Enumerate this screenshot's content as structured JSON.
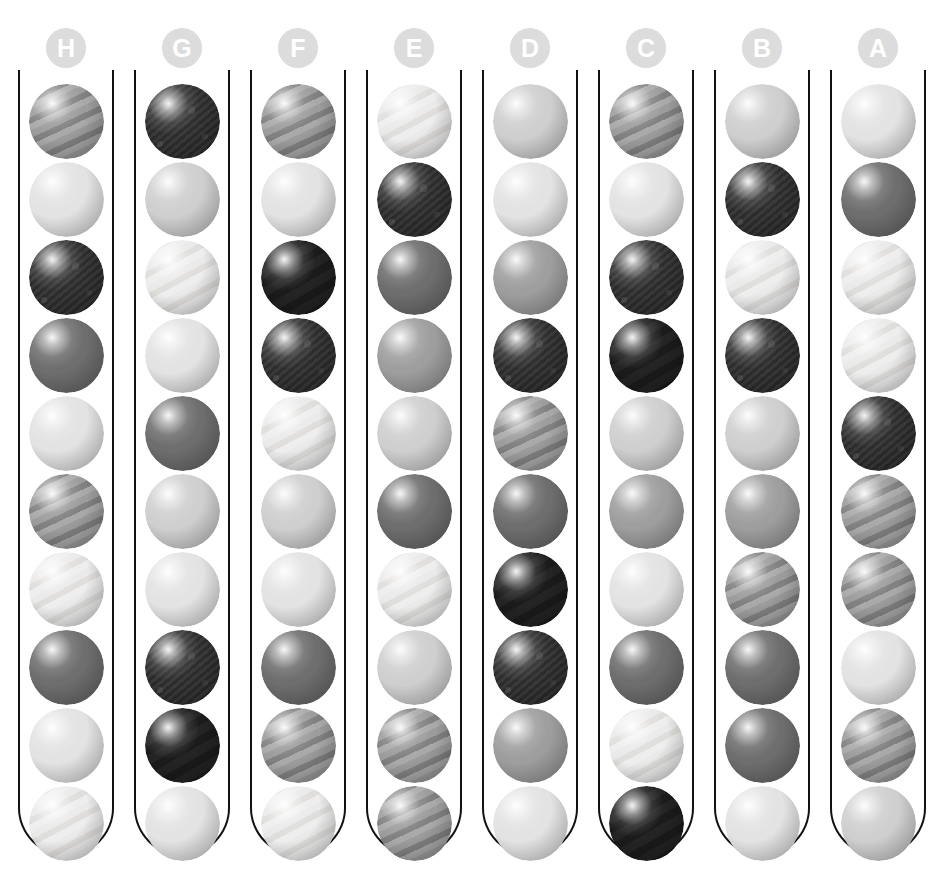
{
  "app": {
    "title": "Ball Sort Puzzle",
    "background_color": "#ffffff",
    "tube_outline_color": "#111111",
    "label_disc_color": "#dcdcdc",
    "label_text_color": "#ffffff"
  },
  "legend": {
    "ball_variants": [
      {
        "id": "v1",
        "name": "very-light-plain",
        "color": "#e3e3e3"
      },
      {
        "id": "v2",
        "name": "very-light-striped",
        "color": "#eaeaea"
      },
      {
        "id": "v3",
        "name": "light-grey-plain",
        "color": "#cfcfcf"
      },
      {
        "id": "v4",
        "name": "medium-grey-plain",
        "color": "#9e9e9e"
      },
      {
        "id": "v5",
        "name": "medium-grey-striped",
        "color": "#9a9a9a"
      },
      {
        "id": "v6",
        "name": "dark-grey-plain",
        "color": "#6e6e6e"
      },
      {
        "id": "v7",
        "name": "near-black-mottled",
        "color": "#333333"
      },
      {
        "id": "v8",
        "name": "black-plain",
        "color": "#202020"
      }
    ]
  },
  "board": {
    "tube_count": 8,
    "balls_per_tube": 10,
    "tubes": [
      {
        "label": "H",
        "balls": [
          "v5",
          "v1",
          "v7",
          "v6",
          "v1",
          "v5",
          "v2",
          "v6",
          "v1",
          "v2"
        ]
      },
      {
        "label": "G",
        "balls": [
          "v7",
          "v3",
          "v2",
          "v1",
          "v6",
          "v3",
          "v1",
          "v7",
          "v8",
          "v1"
        ]
      },
      {
        "label": "F",
        "balls": [
          "v5",
          "v1",
          "v8",
          "v7",
          "v2",
          "v3",
          "v1",
          "v6",
          "v5",
          "v2"
        ]
      },
      {
        "label": "E",
        "balls": [
          "v2",
          "v7",
          "v6",
          "v4",
          "v3",
          "v6",
          "v2",
          "v3",
          "v5",
          "v5"
        ]
      },
      {
        "label": "D",
        "balls": [
          "v3",
          "v1",
          "v4",
          "v7",
          "v5",
          "v6",
          "v8",
          "v7",
          "v4",
          "v1"
        ]
      },
      {
        "label": "C",
        "balls": [
          "v5",
          "v1",
          "v7",
          "v8",
          "v3",
          "v4",
          "v1",
          "v6",
          "v2",
          "v8"
        ]
      },
      {
        "label": "B",
        "balls": [
          "v3",
          "v7",
          "v2",
          "v7",
          "v3",
          "v4",
          "v5",
          "v6",
          "v6",
          "v1"
        ]
      },
      {
        "label": "A",
        "balls": [
          "v1",
          "v6",
          "v2",
          "v2",
          "v7",
          "v5",
          "v5",
          "v1",
          "v5",
          "v3"
        ]
      }
    ]
  }
}
